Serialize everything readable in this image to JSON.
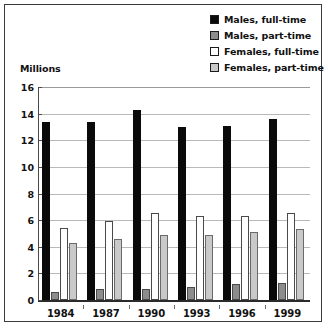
{
  "axis": {
    "y_title": "Millions",
    "y_ticks": [
      "0",
      "2",
      "4",
      "6",
      "8",
      "10",
      "12",
      "14",
      "16"
    ]
  },
  "legend": {
    "items": [
      {
        "label": "Males, full-time",
        "color": "#0a0a0a",
        "key": "males_full"
      },
      {
        "label": "Males, part-time",
        "color": "#8c8c8c",
        "key": "males_part"
      },
      {
        "label": "Females, full-time",
        "color": "#ffffff",
        "key": "females_full"
      },
      {
        "label": "Females, part-time",
        "color": "#c9c9c9",
        "key": "females_part"
      }
    ]
  },
  "chart_data": {
    "type": "bar",
    "title": "",
    "subtitle": "",
    "xlabel": "",
    "ylabel": "Millions",
    "ylim": [
      0,
      16
    ],
    "ytick_step": 2,
    "grid": true,
    "legend_position": "top-right",
    "categories": [
      "1984",
      "1987",
      "1990",
      "1993",
      "1996",
      "1999"
    ],
    "series": [
      {
        "name": "Males, full-time",
        "color": "#0a0a0a",
        "values": [
          13.4,
          13.4,
          14.3,
          13.0,
          13.1,
          13.6
        ]
      },
      {
        "name": "Males, part-time",
        "color": "#8c8c8c",
        "values": [
          0.6,
          0.8,
          0.8,
          1.0,
          1.2,
          1.3
        ]
      },
      {
        "name": "Females, full-time",
        "color": "#ffffff",
        "values": [
          5.4,
          5.9,
          6.5,
          6.3,
          6.3,
          6.5
        ]
      },
      {
        "name": "Females, part-time",
        "color": "#c9c9c9",
        "values": [
          4.3,
          4.6,
          4.9,
          4.9,
          5.1,
          5.3
        ]
      }
    ]
  }
}
